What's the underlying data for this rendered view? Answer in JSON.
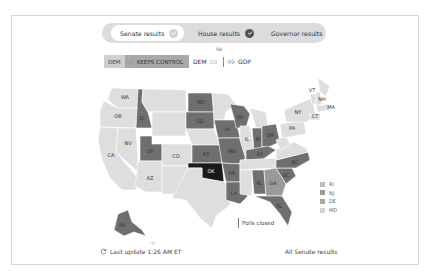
{
  "tabs": [
    {
      "label": "Senate results",
      "active": true,
      "check_color": "#d3d3d3"
    },
    {
      "label": "House results",
      "active": false,
      "check_color": "#555555"
    },
    {
      "label": "Governor results",
      "active": false
    }
  ],
  "control": {
    "party": "DEM",
    "status": "KEEPS CONTROL"
  },
  "score": {
    "majority_label": "50",
    "dem_label": "DEM",
    "dem_seats": "50",
    "gop_seats": "49",
    "gop_label": "GOP"
  },
  "colors": {
    "dem_light": "#d6d6d6",
    "gop_dark": "#6f6f6f",
    "highlight": "#1a1a1a",
    "mid": "#9a9a9a",
    "no_race": "#dedede"
  },
  "map": {
    "states": [
      {
        "id": "WA",
        "label": "WA",
        "status": "no_race"
      },
      {
        "id": "OR",
        "label": "OR",
        "status": "no_race"
      },
      {
        "id": "CA",
        "label": "CA",
        "status": "no_race"
      },
      {
        "id": "NV",
        "label": "NV",
        "status": "no_race"
      },
      {
        "id": "ID",
        "label": "ID",
        "status": "gop"
      },
      {
        "id": "UT",
        "label": "UT",
        "status": "gop"
      },
      {
        "id": "AZ",
        "label": "AZ",
        "status": "no_race"
      },
      {
        "id": "CO",
        "label": "CO",
        "status": "no_race"
      },
      {
        "id": "ND",
        "label": "ND",
        "status": "gop"
      },
      {
        "id": "SD",
        "label": "SD",
        "status": "gop"
      },
      {
        "id": "KS",
        "label": "KS",
        "status": "gop"
      },
      {
        "id": "OK",
        "label": "OK",
        "status": "highlight"
      },
      {
        "id": "IA",
        "label": "IA",
        "status": "gop"
      },
      {
        "id": "MO",
        "label": "MO",
        "status": "gop"
      },
      {
        "id": "AR",
        "label": "AR",
        "status": "gop"
      },
      {
        "id": "LA",
        "label": "LA",
        "status": "gop"
      },
      {
        "id": "WI",
        "label": "WI",
        "status": "gop"
      },
      {
        "id": "IL",
        "label": "IL",
        "status": "no_race"
      },
      {
        "id": "IN",
        "label": "IN",
        "status": "gop"
      },
      {
        "id": "OH",
        "label": "OH",
        "status": "gop"
      },
      {
        "id": "KY",
        "label": "KY",
        "status": "gop"
      },
      {
        "id": "AL",
        "label": "AL",
        "status": "gop"
      },
      {
        "id": "GA",
        "label": "GA",
        "status": "mid"
      },
      {
        "id": "FL",
        "label": "FL",
        "status": "gop"
      },
      {
        "id": "SC",
        "label": "SC",
        "status": "gop"
      },
      {
        "id": "NC",
        "label": "NC",
        "status": "gop"
      },
      {
        "id": "PA",
        "label": "PA",
        "status": "no_race"
      },
      {
        "id": "NY",
        "label": "NY",
        "status": "no_race"
      },
      {
        "id": "VT",
        "label": "VT",
        "status": "no_race"
      },
      {
        "id": "NH",
        "label": "NH",
        "status": "no_race"
      },
      {
        "id": "MA",
        "label": "MA",
        "status": "no_race"
      },
      {
        "id": "CT",
        "label": "CT",
        "status": "no_race"
      },
      {
        "id": "AK",
        "label": "AK",
        "status": "gop"
      }
    ],
    "small_states": [
      {
        "label": "RI",
        "color": "#bdbdbd"
      },
      {
        "label": "NJ",
        "color": "#9a9a9a"
      },
      {
        "label": "DE",
        "color": "#a8a8a8"
      },
      {
        "label": "MD",
        "color": "#d3d3d3"
      }
    ]
  },
  "polls_closed_label": "Polls closed",
  "footer": {
    "last_update": "Last update 1:26 AM ET",
    "all_results_link": "All Senate results"
  }
}
